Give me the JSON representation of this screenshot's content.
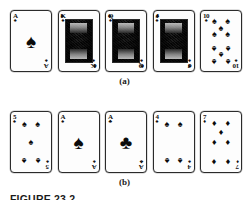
{
  "figure": {
    "caption": "FIGURE 23.2",
    "panel_a_label": "(a)",
    "panel_b_label": "(b)"
  },
  "suits": {
    "spade_glyph": "♠",
    "club_glyph": "♣",
    "heart_glyph": "♥",
    "diamond_glyph": "♦"
  },
  "colors": {
    "card_face": "#fdfdfd",
    "card_border": "#2b2b2b",
    "pip_black": "#0b0b0b",
    "page_background": "#ffffff"
  },
  "rows": [
    {
      "id": "row-a",
      "label": "(a)",
      "cards": [
        {
          "rank": "A",
          "suit": "spade",
          "suit_glyph": "♠",
          "kind": "ace",
          "pip_count": 1
        },
        {
          "rank": "K",
          "suit": "spade",
          "suit_glyph": "♠",
          "kind": "face",
          "pip_count": 0
        },
        {
          "rank": "Q",
          "suit": "spade",
          "suit_glyph": "♠",
          "kind": "face",
          "pip_count": 0
        },
        {
          "rank": "J",
          "suit": "spade",
          "suit_glyph": "♠",
          "kind": "face",
          "pip_count": 0
        },
        {
          "rank": "10",
          "suit": "spade",
          "suit_glyph": "♠",
          "kind": "pip",
          "pip_count": 10
        }
      ]
    },
    {
      "id": "row-b",
      "label": "(b)",
      "cards": [
        {
          "rank": "5",
          "suit": "spade",
          "suit_glyph": "♠",
          "kind": "pip",
          "pip_count": 5
        },
        {
          "rank": "A",
          "suit": "spade",
          "suit_glyph": "♠",
          "kind": "ace",
          "pip_count": 1
        },
        {
          "rank": "A",
          "suit": "club",
          "suit_glyph": "♣",
          "kind": "ace",
          "pip_count": 1
        },
        {
          "rank": "4",
          "suit": "spade",
          "suit_glyph": "♠",
          "kind": "pip",
          "pip_count": 4
        },
        {
          "rank": "7",
          "suit": "diamond",
          "suit_glyph": "♦",
          "kind": "pip",
          "pip_count": 7
        }
      ]
    }
  ]
}
